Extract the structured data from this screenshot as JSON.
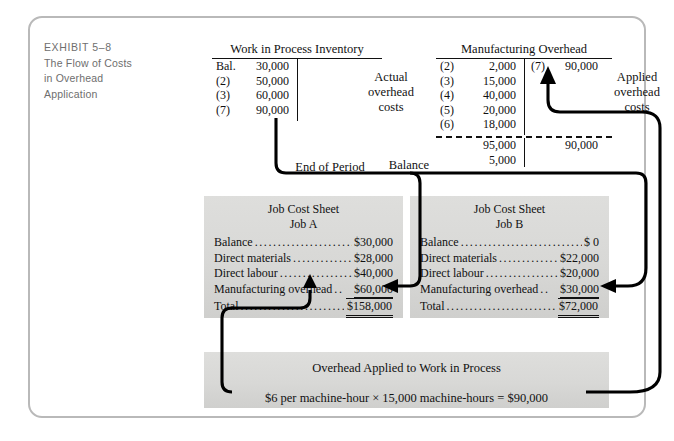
{
  "exhibit": {
    "number": "EXHIBIT 5–8",
    "title_line1": "The Flow of Costs",
    "title_line2": "in Overhead",
    "title_line3": "Application"
  },
  "accounts": {
    "wip": {
      "title": "Work in Process Inventory",
      "debits": [
        {
          "ref": "Bal.",
          "amount": "30,000"
        },
        {
          "ref": "(2)",
          "amount": "50,000"
        },
        {
          "ref": "(3)",
          "amount": "60,000"
        },
        {
          "ref": "(7)",
          "amount": "90,000"
        }
      ],
      "credits": []
    },
    "moh": {
      "title": "Manufacturing Overhead",
      "debits": [
        {
          "ref": "(2)",
          "amount": "2,000"
        },
        {
          "ref": "(3)",
          "amount": "15,000"
        },
        {
          "ref": "(4)",
          "amount": "40,000"
        },
        {
          "ref": "(5)",
          "amount": "20,000"
        },
        {
          "ref": "(6)",
          "amount": "18,000"
        }
      ],
      "credits": [
        {
          "ref": "(7)",
          "amount": "90,000"
        }
      ],
      "debit_total": "95,000",
      "credit_total": "90,000",
      "balance": "5,000"
    }
  },
  "labels": {
    "actual_overhead_costs": "Actual\noverhead\ncosts",
    "actual_line1": "Actual",
    "actual_line2": "overhead",
    "actual_line3": "costs",
    "applied_line1": "Applied",
    "applied_line2": "overhead",
    "applied_line3": "costs",
    "end_of_period": "End of Period",
    "balance": "Balance"
  },
  "job_sheets": [
    {
      "sheet_title": "Job Cost Sheet",
      "job_name": "Job A",
      "rows": [
        {
          "label": "Balance",
          "value": "$30,000",
          "style": "plain"
        },
        {
          "label": "Direct materials",
          "value": "$28,000",
          "style": "plain"
        },
        {
          "label": "Direct labour",
          "value": "$40,000",
          "style": "plain"
        },
        {
          "label": "Manufacturing overhead",
          "value": "$60,000",
          "style": "underline-single"
        },
        {
          "label": "Total",
          "value": "$158,000",
          "style": "underline-double"
        }
      ]
    },
    {
      "sheet_title": "Job Cost Sheet",
      "job_name": "Job B",
      "rows": [
        {
          "label": "Balance",
          "value": "$ 0",
          "style": "plain"
        },
        {
          "label": "Direct materials",
          "value": "$22,000",
          "style": "plain"
        },
        {
          "label": "Direct labour",
          "value": "$20,000",
          "style": "plain"
        },
        {
          "label": "Manufacturing overhead",
          "value": "$30,000",
          "style": "underline-single"
        },
        {
          "label": "Total",
          "value": "$72,000",
          "style": "underline-double"
        }
      ]
    }
  ],
  "applied_box": {
    "title": "Overhead Applied to Work in Process",
    "formula": "$6 per machine-hour × 15,000 machine-hours = $90,000"
  },
  "colors": {
    "frame_border": "#b9b9b9",
    "caption_text": "#6e6e6e",
    "box_fill": "#d8d8d6",
    "ink": "#111111",
    "connector": "#000000"
  }
}
